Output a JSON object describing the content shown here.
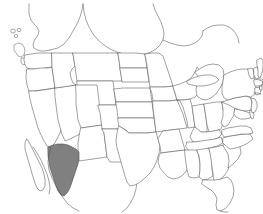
{
  "map": {
    "title": "Map of the United States",
    "projection": "equirectangular-conus",
    "background_color": "#ffffff",
    "border_color": "#555555",
    "region_fill_color": "#ffffff",
    "highlight_fill_color": "#808080",
    "highlighted_region_name": "Sonora",
    "highlighted_region_country": "Mexico",
    "legend_visible": false,
    "labels_visible": false,
    "graticule_visible": false,
    "regions": [
      {
        "name": "Washington",
        "highlighted": false
      },
      {
        "name": "Oregon",
        "highlighted": false
      },
      {
        "name": "California",
        "highlighted": false
      },
      {
        "name": "Nevada",
        "highlighted": false
      },
      {
        "name": "Idaho",
        "highlighted": false
      },
      {
        "name": "Montana",
        "highlighted": false
      },
      {
        "name": "Wyoming",
        "highlighted": false
      },
      {
        "name": "Utah",
        "highlighted": false
      },
      {
        "name": "Arizona",
        "highlighted": false
      },
      {
        "name": "Colorado",
        "highlighted": false
      },
      {
        "name": "New Mexico",
        "highlighted": false
      },
      {
        "name": "North Dakota",
        "highlighted": false
      },
      {
        "name": "South Dakota",
        "highlighted": false
      },
      {
        "name": "Nebraska",
        "highlighted": false
      },
      {
        "name": "Kansas",
        "highlighted": false
      },
      {
        "name": "Oklahoma",
        "highlighted": false
      },
      {
        "name": "Texas",
        "highlighted": false
      },
      {
        "name": "Minnesota",
        "highlighted": false
      },
      {
        "name": "Iowa",
        "highlighted": false
      },
      {
        "name": "Missouri",
        "highlighted": false
      },
      {
        "name": "Arkansas",
        "highlighted": false
      },
      {
        "name": "Louisiana",
        "highlighted": false
      },
      {
        "name": "Wisconsin",
        "highlighted": false
      },
      {
        "name": "Illinois",
        "highlighted": false
      },
      {
        "name": "Michigan",
        "highlighted": false
      },
      {
        "name": "Indiana",
        "highlighted": false
      },
      {
        "name": "Ohio",
        "highlighted": false
      },
      {
        "name": "Kentucky",
        "highlighted": false
      },
      {
        "name": "Tennessee",
        "highlighted": false
      },
      {
        "name": "Mississippi",
        "highlighted": false
      },
      {
        "name": "Alabama",
        "highlighted": false
      },
      {
        "name": "Georgia",
        "highlighted": false
      },
      {
        "name": "Florida",
        "highlighted": false
      },
      {
        "name": "South Carolina",
        "highlighted": false
      },
      {
        "name": "North Carolina",
        "highlighted": false
      },
      {
        "name": "Virginia",
        "highlighted": false
      },
      {
        "name": "West Virginia",
        "highlighted": false
      },
      {
        "name": "Maryland",
        "highlighted": false
      },
      {
        "name": "Delaware",
        "highlighted": false
      },
      {
        "name": "Pennsylvania",
        "highlighted": false
      },
      {
        "name": "New Jersey",
        "highlighted": false
      },
      {
        "name": "New York",
        "highlighted": false
      },
      {
        "name": "Connecticut",
        "highlighted": false
      },
      {
        "name": "Rhode Island",
        "highlighted": false
      },
      {
        "name": "Massachusetts",
        "highlighted": false
      },
      {
        "name": "Vermont",
        "highlighted": false
      },
      {
        "name": "New Hampshire",
        "highlighted": false
      },
      {
        "name": "Maine",
        "highlighted": false
      },
      {
        "name": "Sonora",
        "highlighted": true
      }
    ]
  }
}
